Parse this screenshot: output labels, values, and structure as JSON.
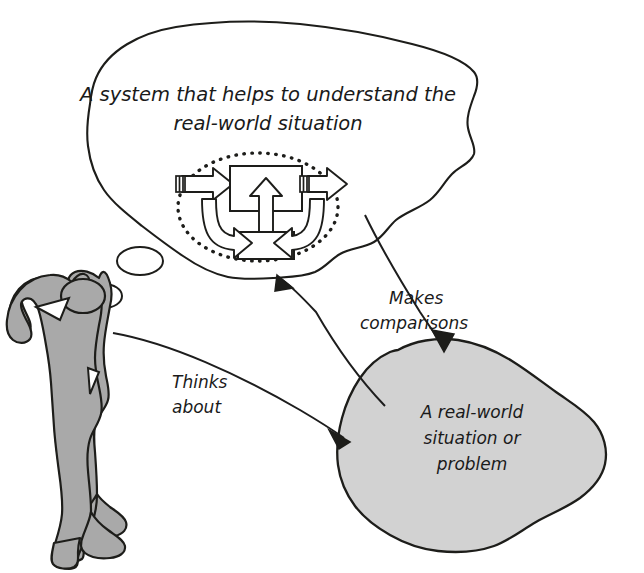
{
  "diagram": {
    "title_text": "",
    "colors": {
      "ink": "#1d1d1a",
      "person_fill": "#a9a9a9",
      "blob_fill": "#d2d2d2",
      "bubble_fill": "#ffffff",
      "background": "#ffffff"
    },
    "thought_bubble": {
      "name": "thought-bubble",
      "line1": "A system that helps to understand the",
      "line2": "real-world situation",
      "trail": [
        "small-thought-ellipse",
        "tiny-thought-ellipse"
      ]
    },
    "system_model": {
      "name": "system-model",
      "boundary": "dotted-ellipse-boundary",
      "main_box_label": "",
      "feedback_box_label": "",
      "input_arrow_label": "",
      "output_arrow_label": ""
    },
    "real_world_blob": {
      "name": "real-world-blob",
      "line1": "A real-world",
      "line2": "situation or",
      "line3": "problem"
    },
    "person": {
      "name": "thinking-person",
      "label": ""
    },
    "connectors": [
      {
        "name": "makes-comparisons-connector",
        "line1": "Makes",
        "line2": "comparisons"
      },
      {
        "name": "thinks-about-connector",
        "line1": "Thinks",
        "line2": "about"
      }
    ]
  }
}
